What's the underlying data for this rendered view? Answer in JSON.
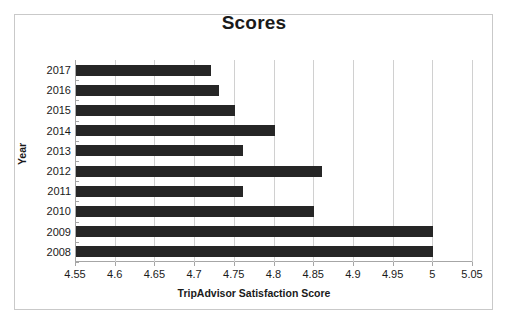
{
  "chart_data": {
    "type": "bar",
    "orientation": "horizontal",
    "title": "Scores",
    "xlabel": "TripAdvisor Satisfaction Score",
    "ylabel": "Year",
    "categories": [
      "2017",
      "2016",
      "2015",
      "2014",
      "2013",
      "2012",
      "2011",
      "2010",
      "2009",
      "2008"
    ],
    "values": [
      4.72,
      4.73,
      4.75,
      4.8,
      4.76,
      4.86,
      4.76,
      4.85,
      5.0,
      5.0
    ],
    "series": [
      {
        "name": "Scores",
        "values": [
          4.72,
          4.73,
          4.75,
          4.8,
          4.76,
          4.86,
          4.76,
          4.85,
          5.0,
          5.0
        ]
      }
    ],
    "xlim": [
      4.55,
      5.05
    ],
    "xtick_labels": [
      "4.55",
      "4.6",
      "4.65",
      "4.7",
      "4.75",
      "4.8",
      "4.85",
      "4.9",
      "4.95",
      "5",
      "5.05"
    ],
    "xtick_values": [
      4.55,
      4.6,
      4.65,
      4.7,
      4.75,
      4.8,
      4.85,
      4.9,
      4.95,
      5.0,
      5.05
    ],
    "ytick_labels": [
      "2017",
      "2016",
      "2015",
      "2014",
      "2013",
      "2012",
      "2011",
      "2010",
      "2009",
      "2008"
    ],
    "grid": true,
    "grid_axis": "x",
    "legend": false,
    "bar_color": "#262626",
    "gridline_color": "#d0d0d0",
    "axis_color": "#a6a6a6",
    "border_color": "#c9c9c9",
    "text_color": "#1a1a1a"
  }
}
